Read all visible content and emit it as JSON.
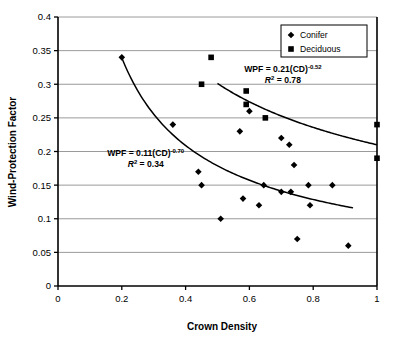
{
  "chart_data": {
    "type": "scatter",
    "title": "",
    "xlabel": "Crown Density",
    "ylabel": "Wind-Protection Factor",
    "xlim": [
      0,
      1
    ],
    "ylim": [
      0,
      0.4
    ],
    "xticks": [
      "0",
      "0.2",
      "0.4",
      "0.6",
      "0.8",
      "1"
    ],
    "xtick_values": [
      0,
      0.2,
      0.4,
      0.6,
      0.8,
      1
    ],
    "yticks": [
      "0",
      "0.05",
      "0.1",
      "0.15",
      "0.2",
      "0.25",
      "0.3",
      "0.35",
      "0.4"
    ],
    "ytick_values": [
      0,
      0.05,
      0.1,
      0.15,
      0.2,
      0.25,
      0.3,
      0.35,
      0.4
    ],
    "grid": "horizontal",
    "legend_position": "top-right",
    "series": [
      {
        "name": "Conifer",
        "marker": "diamond",
        "color": "#000000",
        "points": [
          [
            0.2,
            0.34
          ],
          [
            0.36,
            0.24
          ],
          [
            0.44,
            0.17
          ],
          [
            0.45,
            0.15
          ],
          [
            0.51,
            0.1
          ],
          [
            0.57,
            0.23
          ],
          [
            0.58,
            0.13
          ],
          [
            0.6,
            0.26
          ],
          [
            0.63,
            0.12
          ],
          [
            0.645,
            0.15
          ],
          [
            0.7,
            0.22
          ],
          [
            0.7,
            0.14
          ],
          [
            0.725,
            0.21
          ],
          [
            0.73,
            0.14
          ],
          [
            0.74,
            0.18
          ],
          [
            0.75,
            0.07
          ],
          [
            0.785,
            0.15
          ],
          [
            0.79,
            0.12
          ],
          [
            0.86,
            0.15
          ],
          [
            0.91,
            0.06
          ]
        ]
      },
      {
        "name": "Deciduous",
        "marker": "square",
        "color": "#000000",
        "points": [
          [
            0.48,
            0.34
          ],
          [
            0.45,
            0.3
          ],
          [
            0.59,
            0.29
          ],
          [
            0.59,
            0.27
          ],
          [
            0.65,
            0.25
          ],
          [
            1.0,
            0.24
          ],
          [
            1.0,
            0.19
          ]
        ]
      }
    ],
    "fit_curves": [
      {
        "name": "conifer-fit",
        "equation_label": "WPF = 0.11(CD)",
        "exponent": "-0.70",
        "r2_label": "R",
        "r2_value": "= 0.34",
        "coefficient": 0.11,
        "power": -0.7,
        "r_squared": 0.34,
        "x_start": 0.2,
        "x_end": 0.925
      },
      {
        "name": "deciduous-fit",
        "equation_label": "WPF = 0.21(CD)",
        "exponent": "-0.52",
        "r2_label": "R",
        "r2_value": "= 0.78",
        "coefficient": 0.21,
        "power": -0.52,
        "r_squared": 0.78,
        "x_start": 0.5,
        "x_end": 1.0
      }
    ],
    "annotations": [
      {
        "id": "deciduous-equation",
        "line1_base": "WPF = 0.21(CD)",
        "line1_sup": "-0.52",
        "line2_base": "R",
        "line2_sup": "2",
        "line2_rest": " = 0.78",
        "x": 0.705,
        "y": 0.3175
      },
      {
        "id": "conifer-equation",
        "line1_base": "WPF = 0.11(CD)",
        "line1_sup": "-0.70",
        "line2_base": "R",
        "line2_sup": "2",
        "line2_rest": " = 0.34",
        "x": 0.275,
        "y": 0.194
      }
    ],
    "legend": {
      "entries": [
        {
          "label": "Conifer",
          "marker": "diamond"
        },
        {
          "label": "Deciduous",
          "marker": "square"
        }
      ]
    }
  }
}
